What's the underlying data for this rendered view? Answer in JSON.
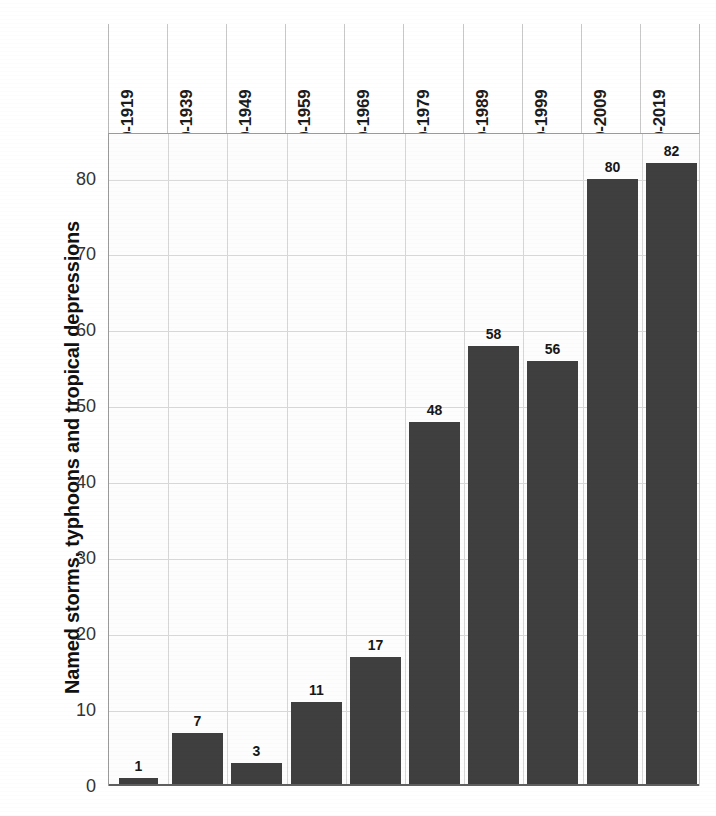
{
  "chart_data": {
    "type": "bar",
    "title": "",
    "xlabel": "",
    "ylabel": "Named storms, typhoons and tropical depressions",
    "ylim": [
      0,
      86
    ],
    "yticks": [
      0,
      10,
      20,
      30,
      40,
      50,
      60,
      70,
      80
    ],
    "grid": true,
    "legend": "none",
    "categories": [
      "1910-1919",
      "1930-1939",
      "1940-1949",
      "1950-1959",
      "1960-1969",
      "1970-1979",
      "1980-1989",
      "1990-1999",
      "2000-2009",
      "2010-2019"
    ],
    "values": [
      1,
      7,
      3,
      11,
      17,
      48,
      58,
      56,
      80,
      82
    ],
    "bar_labels": [
      "1",
      "7",
      "3",
      "11",
      "17",
      "48",
      "58",
      "56",
      "80",
      "82"
    ],
    "colors": {
      "bar": "#3f3f3f",
      "grid": "#dadada",
      "axis": "#5f5f5f",
      "text": "#171717",
      "background": "#ffffff"
    }
  },
  "axis": {
    "y_tick_labels": [
      "80",
      "70",
      "60",
      "50",
      "40",
      "30",
      "20",
      "10",
      "0"
    ],
    "y_title": "Named storms, typhoons and tropical depressions"
  }
}
